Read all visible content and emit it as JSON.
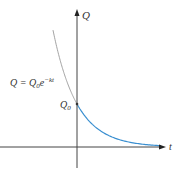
{
  "chart_data": {
    "type": "line",
    "title": "",
    "xlabel": "t",
    "ylabel": "Q",
    "equation_label": {
      "lhs": "Q = Q",
      "sub": "0",
      "base": "e",
      "exp": "−kt"
    },
    "intercept_label": {
      "main": "Q",
      "sub": "0"
    },
    "function": "Q = Q0 * exp(-k t)",
    "Q0": 1,
    "k": 1,
    "series": [
      {
        "name": "Q = Q0 e^(-kt), t < 0",
        "color": "#999999",
        "t_range": [
          -1.0,
          0
        ]
      },
      {
        "name": "Q = Q0 e^(-kt), t >= 0",
        "color": "#3a8fd0",
        "t_range": [
          0,
          3.5
        ]
      }
    ],
    "xlim": [
      -3.2,
      3.7
    ],
    "ylim": [
      -0.5,
      3.1
    ],
    "grid": false,
    "legend": "none"
  }
}
